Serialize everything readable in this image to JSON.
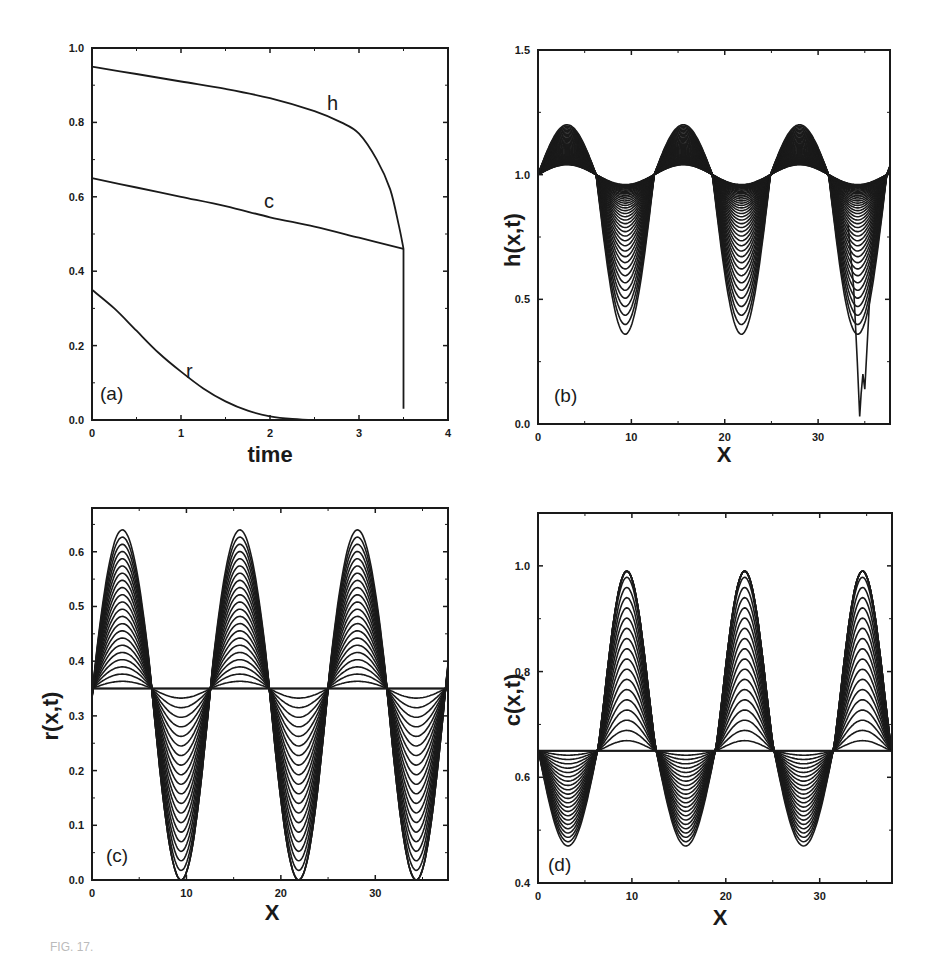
{
  "figure": {
    "caption_fragment": "FIG. 17."
  },
  "panels": [
    {
      "id": "a",
      "label": "(a)",
      "xlabel": "time",
      "ylabel": "",
      "xticks": [
        "0",
        "1",
        "2",
        "3",
        "4"
      ],
      "yticks": [
        "0.0",
        "0.2",
        "0.4",
        "0.6",
        "0.8",
        "1.0"
      ],
      "curve_labels": {
        "h": "h",
        "c": "c",
        "r": "r"
      }
    },
    {
      "id": "b",
      "label": "(b)",
      "xlabel": "X",
      "ylabel": "h(x,t)",
      "xticks": [
        "0",
        "10",
        "20",
        "30"
      ],
      "yticks": [
        "0.0",
        "0.5",
        "1.0",
        "1.5"
      ]
    },
    {
      "id": "c",
      "label": "(c)",
      "xlabel": "X",
      "ylabel": "r(x,t)",
      "xticks": [
        "0",
        "10",
        "20",
        "30"
      ],
      "yticks": [
        "0.0",
        "0.1",
        "0.2",
        "0.3",
        "0.4",
        "0.5",
        "0.6"
      ]
    },
    {
      "id": "d",
      "label": "(d)",
      "xlabel": "X",
      "ylabel": "c(x,t)",
      "xticks": [
        "0",
        "10",
        "20",
        "30"
      ],
      "yticks": [
        "0.4",
        "0.6",
        "0.8",
        "1.0"
      ]
    }
  ],
  "chart_data": [
    {
      "type": "line",
      "title": "(a)",
      "xlabel": "time",
      "ylabel": "",
      "xlim": [
        0,
        4
      ],
      "ylim": [
        0,
        1.0
      ],
      "grid": false,
      "legend": "inline curve labels",
      "series": [
        {
          "name": "h",
          "x": [
            0,
            0.5,
            1.0,
            1.5,
            2.0,
            2.5,
            2.8,
            3.0,
            3.2,
            3.35,
            3.45,
            3.5,
            3.5
          ],
          "y": [
            0.95,
            0.93,
            0.91,
            0.89,
            0.865,
            0.83,
            0.8,
            0.77,
            0.7,
            0.62,
            0.52,
            0.46,
            0.03
          ]
        },
        {
          "name": "c",
          "x": [
            0,
            0.5,
            1.0,
            1.5,
            2.0,
            2.5,
            3.0,
            3.5
          ],
          "y": [
            0.65,
            0.625,
            0.6,
            0.575,
            0.545,
            0.52,
            0.49,
            0.46
          ]
        },
        {
          "name": "r",
          "x": [
            0,
            0.25,
            0.5,
            0.75,
            1.0,
            1.25,
            1.5,
            1.75,
            2.0,
            2.25,
            2.5,
            2.75
          ],
          "y": [
            0.35,
            0.3,
            0.24,
            0.18,
            0.13,
            0.085,
            0.05,
            0.025,
            0.01,
            0.003,
            0.0,
            0.0
          ]
        }
      ]
    },
    {
      "type": "line",
      "title": "(b)",
      "xlabel": "X",
      "ylabel": "h(x,t)",
      "xlim": [
        0,
        37.7
      ],
      "ylim": [
        0,
        1.5
      ],
      "grid": false,
      "description": "Family of h(x,t) profiles over time; periodic with peaks near x=4,16,28 and troughs near x=9.5,22,34.5",
      "peaks": [
        {
          "x": 3.8,
          "max": 1.2
        },
        {
          "x": 15.8,
          "max": 1.22
        },
        {
          "x": 28.3,
          "max": 1.22
        }
      ],
      "troughs": [
        {
          "x": 9.5,
          "min": 0.6
        },
        {
          "x": 22.0,
          "min": 0.58
        },
        {
          "x": 34.5,
          "min": 0.03
        }
      ],
      "baseline": 1.0
    },
    {
      "type": "line",
      "title": "(c)",
      "xlabel": "X",
      "ylabel": "r(x,t)",
      "xlim": [
        0,
        37.7
      ],
      "ylim": [
        0,
        0.68
      ],
      "grid": false,
      "description": "Family of r(x,t) profiles; initial uniform 0.35, evolving to peaks and troughs",
      "baseline": 0.35,
      "peaks": [
        {
          "x": 3.2,
          "max": 0.62
        },
        {
          "x": 15.6,
          "max": 0.64
        },
        {
          "x": 28.1,
          "max": 0.64
        }
      ],
      "troughs": [
        {
          "x": 9.5,
          "min": 0.0
        },
        {
          "x": 22.0,
          "min": 0.0
        },
        {
          "x": 34.5,
          "min": 0.0
        }
      ]
    },
    {
      "type": "line",
      "title": "(d)",
      "xlabel": "X",
      "ylabel": "c(x,t)",
      "xlim": [
        0,
        37.7
      ],
      "ylim": [
        0.4,
        1.1
      ],
      "grid": false,
      "description": "Family of c(x,t) profiles; initial uniform 0.65, peaks saturate near 1.0, troughs near 0.47",
      "baseline": 0.65,
      "peaks": [
        {
          "x": 9.4,
          "max": 0.99
        },
        {
          "x": 22.0,
          "max": 0.99
        },
        {
          "x": 34.6,
          "max": 0.99
        }
      ],
      "troughs": [
        {
          "x": 3.2,
          "min": 0.47
        },
        {
          "x": 15.7,
          "min": 0.47
        },
        {
          "x": 28.3,
          "min": 0.47
        }
      ]
    }
  ]
}
